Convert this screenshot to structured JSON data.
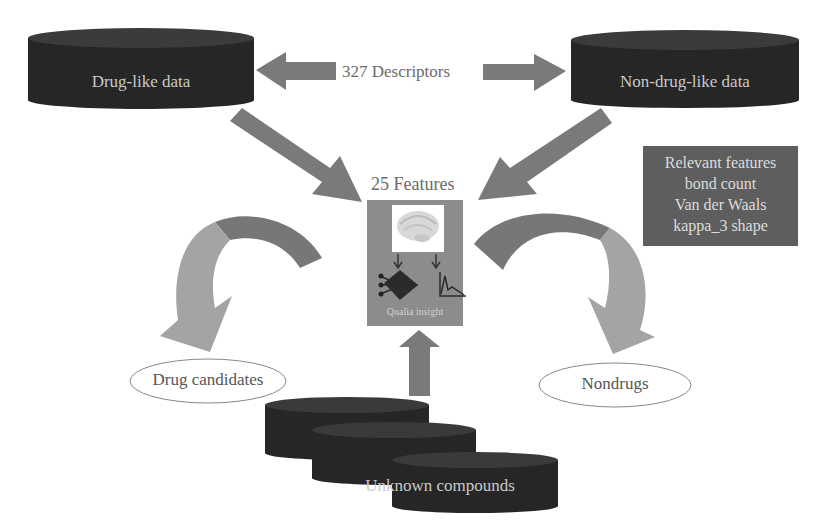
{
  "databases": {
    "drug_like": "Drug-like data",
    "non_drug_like": "Non-drug-like data",
    "unknown": "Unknown compounds"
  },
  "descriptors_label": "327 Descriptors",
  "features_label": "25 Features",
  "model": {
    "label": "Qualia insight",
    "icons": [
      "brain-icon",
      "neural-network-icon",
      "chart-icon"
    ]
  },
  "relevant_features": {
    "title": "Relevant features",
    "items": [
      "bond count",
      "Van der Waals",
      "kappa_3 shape"
    ]
  },
  "outputs": {
    "left": "Drug candidates",
    "right": "Nondrugs"
  },
  "colors": {
    "database": "#2a2a2a",
    "database_top": "#3a3a3a",
    "arrow": "#7a7a7a",
    "arrow_light": "#a3a3a3",
    "model_box": "#8c8c8c",
    "features_box": "#5e5e5e"
  }
}
